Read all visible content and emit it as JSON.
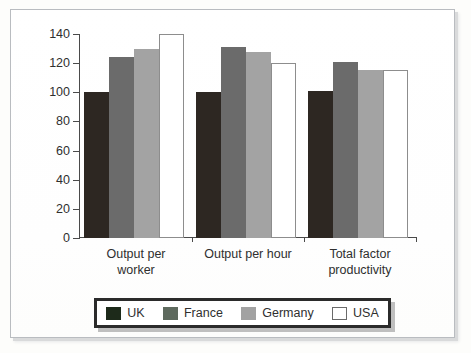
{
  "chart_data": {
    "type": "bar",
    "title": "",
    "subtitle": "",
    "xlabel": "",
    "ylabel": "",
    "ylim": [
      0,
      140
    ],
    "yticks": [
      0,
      20,
      40,
      60,
      80,
      100,
      120,
      140
    ],
    "grid": false,
    "legend_position": "bottom",
    "categories": [
      "Output per worker",
      "Output per hour",
      "Total factor productivity"
    ],
    "category_lines": [
      [
        "Output per",
        "worker"
      ],
      [
        "Output per hour",
        ""
      ],
      [
        "Total factor",
        "productivity"
      ]
    ],
    "series": [
      {
        "name": "UK",
        "color": "#2d2722",
        "values": [
          100,
          100,
          101
        ]
      },
      {
        "name": "France",
        "color": "#6b6b6b",
        "values": [
          124,
          131,
          121
        ]
      },
      {
        "name": "Germany",
        "color": "#a3a3a3",
        "values": [
          130,
          128,
          115
        ]
      },
      {
        "name": "USA",
        "color": "#ffffff",
        "values": [
          140,
          120,
          115
        ]
      }
    ]
  },
  "legend": {
    "items": [
      {
        "label": "UK",
        "swatch": "uk"
      },
      {
        "label": "France",
        "swatch": "france"
      },
      {
        "label": "Germany",
        "swatch": "germany"
      },
      {
        "label": "USA",
        "swatch": "usa"
      }
    ]
  },
  "axis": {
    "y_tick_labels": [
      "140",
      "120",
      "100",
      "80",
      "60",
      "40",
      "20",
      "0"
    ]
  }
}
